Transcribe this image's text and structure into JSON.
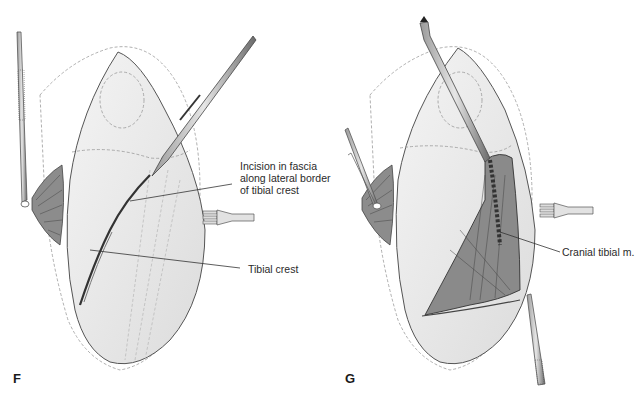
{
  "figure": {
    "panels": [
      {
        "id": "F",
        "letter": "F",
        "annotations": [
          {
            "text": "Incision in fascia\nalong lateral border\nof tibial crest"
          },
          {
            "text": "Tibial crest"
          }
        ]
      },
      {
        "id": "G",
        "letter": "G",
        "annotations": [
          {
            "text": "Cranial tibial m."
          }
        ]
      }
    ]
  },
  "colors": {
    "ink": "#2a2a2a",
    "skin": "#ececec",
    "muscle": "#9a9a9a",
    "instrument": "#6a6a6a",
    "background": "#ffffff"
  }
}
